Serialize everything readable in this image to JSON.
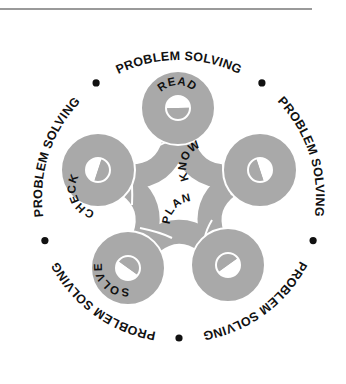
{
  "figure": {
    "ring_phrases": [
      "PROBLEM SOLVING",
      "PROBLEM SOLVING",
      "PROBLEM SOLVING",
      "PROBLEM SOLVING",
      "PROBLEM SOLVING"
    ],
    "ring_separator": "•",
    "loops": [
      {
        "id": "read",
        "label": "READ"
      },
      {
        "id": "know",
        "label": "KNOW"
      },
      {
        "id": "plan",
        "label": "PLAN"
      },
      {
        "id": "solve",
        "label": "SOLVE"
      },
      {
        "id": "check",
        "label": "CHECK"
      }
    ],
    "colors": {
      "ribbon": "#a9a9a9",
      "text": "#111111",
      "rule": "#9a9a9a",
      "background": "#ffffff"
    }
  }
}
